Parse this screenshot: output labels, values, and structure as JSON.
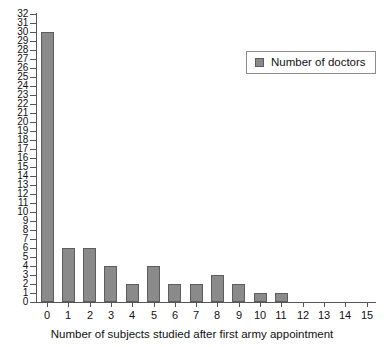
{
  "chart_data": {
    "type": "bar",
    "title": "",
    "xlabel": "Number of subjects studied after first army appointment",
    "ylabel": "",
    "categories": [
      "0",
      "1",
      "2",
      "3",
      "4",
      "5",
      "6",
      "7",
      "8",
      "9",
      "10",
      "11",
      "12",
      "13",
      "14",
      "15"
    ],
    "values": [
      30,
      6,
      6,
      4,
      2,
      4,
      2,
      2,
      3,
      2,
      1,
      1,
      0,
      0,
      0,
      0
    ],
    "series": [
      {
        "name": "Number of doctors",
        "values": [
          30,
          6,
          6,
          4,
          2,
          4,
          2,
          2,
          3,
          2,
          1,
          1,
          0,
          0,
          0,
          0
        ],
        "color": "#8a8a8a"
      }
    ],
    "xlim": [
      -0.5,
      15.5
    ],
    "ylim": [
      0,
      32
    ],
    "ytick_labels": [
      "0",
      "1",
      "2",
      "3",
      "4",
      "5",
      "6",
      "7",
      "8",
      "9",
      "10",
      "11",
      "12",
      "13",
      "14",
      "15",
      "16",
      "17",
      "18",
      "19",
      "20",
      "21",
      "22",
      "23",
      "24",
      "25",
      "26",
      "27",
      "28",
      "29",
      "30",
      "31",
      "32"
    ],
    "ytick_values": [
      0,
      1,
      2,
      3,
      4,
      5,
      6,
      7,
      8,
      9,
      10,
      11,
      12,
      13,
      14,
      15,
      16,
      17,
      18,
      19,
      20,
      21,
      22,
      23,
      24,
      25,
      26,
      27,
      28,
      29,
      30,
      31,
      32
    ],
    "xtick_labels": [
      "0",
      "1",
      "2",
      "3",
      "4",
      "5",
      "6",
      "7",
      "8",
      "9",
      "10",
      "11",
      "12",
      "13",
      "14",
      "15"
    ],
    "grid": false,
    "legend": {
      "position": "top-right",
      "entries": [
        {
          "label": "Number of doctors",
          "color": "#8a8a8a"
        }
      ]
    }
  },
  "legend": {
    "label": "Number of doctors",
    "swatch_name": "legend-swatch-number-of-doctors"
  },
  "axes": {
    "x_title": "Number of subjects studied after first army appointment"
  },
  "colors": {
    "bar_fill": "#8a8a8a",
    "bar_stroke": "#5d5d5d",
    "axis": "#555555",
    "text": "#111111",
    "background": "#ffffff"
  }
}
